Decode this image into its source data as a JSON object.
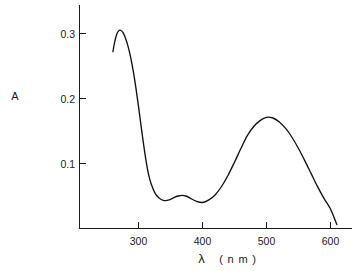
{
  "chart_data": {
    "type": "line",
    "title": "",
    "subtitle": "",
    "xlabel": "λ ( n m )",
    "ylabel": "A",
    "xlabel_symbol": "λ",
    "xlabel_unit": "( n m )",
    "xlim": [
      248,
      360
    ],
    "ylim": [
      0,
      0.345
    ],
    "xticks": [
      300,
      400,
      500,
      600
    ],
    "xtick_labels": [
      "300",
      "400",
      "500",
      "600"
    ],
    "yticks": [
      0.1,
      0.2,
      0.3
    ],
    "ytick_labels": [
      "0.1",
      "0.2",
      "0.3"
    ],
    "grid": false,
    "legend": null,
    "legend_position": "none",
    "x_axis_range_nm": [
      248,
      360
    ],
    "series": [
      {
        "name": "absorbance",
        "color": "#111111",
        "x": [
          260,
          263,
          266,
          269,
          272,
          276,
          280,
          284,
          288,
          292,
          296,
          300,
          304,
          308,
          312,
          316,
          320,
          326,
          332,
          340,
          348,
          356,
          362,
          368,
          374,
          382,
          390,
          400,
          410,
          420,
          430,
          440,
          450,
          460,
          470,
          480,
          490,
          500,
          510,
          520,
          530,
          540,
          550,
          560,
          570,
          580,
          590,
          600,
          610
        ],
        "y": [
          0.272,
          0.288,
          0.299,
          0.304,
          0.305,
          0.301,
          0.292,
          0.279,
          0.262,
          0.241,
          0.216,
          0.188,
          0.158,
          0.129,
          0.103,
          0.082,
          0.068,
          0.054,
          0.047,
          0.043,
          0.044,
          0.048,
          0.05,
          0.051,
          0.05,
          0.046,
          0.042,
          0.04,
          0.044,
          0.052,
          0.065,
          0.082,
          0.102,
          0.123,
          0.143,
          0.157,
          0.166,
          0.171,
          0.17,
          0.164,
          0.154,
          0.14,
          0.123,
          0.104,
          0.084,
          0.064,
          0.046,
          0.03,
          0.006
        ]
      }
    ],
    "annotations": [
      {
        "name": "peak-1",
        "x": 272,
        "y": 0.305,
        "label": ""
      },
      {
        "name": "shoulder-peak",
        "x": 368,
        "y": 0.051,
        "label": ""
      },
      {
        "name": "peak-2",
        "x": 500,
        "y": 0.171,
        "label": ""
      }
    ],
    "colors": {
      "curve": "#111111",
      "axis": "#1a1a1a",
      "text": "#1a1a1a",
      "background": "#ffffff"
    }
  }
}
